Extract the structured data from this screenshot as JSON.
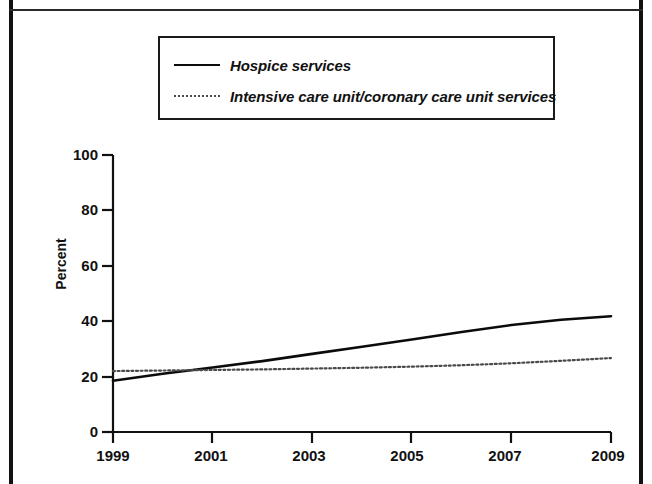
{
  "figure": {
    "background": "#ffffff",
    "frame_color": "#111111"
  },
  "legend": {
    "position": "top-center",
    "items": [
      {
        "label": "Hospice services",
        "style": "solid",
        "color": "#0b0b0b"
      },
      {
        "label": "Intensive care unit/coronary care unit services",
        "style": "dotted",
        "color": "#4a4a4a"
      }
    ]
  },
  "axes": {
    "ylabel": "Percent",
    "yticks": [
      "100",
      "80",
      "60",
      "40",
      "20",
      "0"
    ],
    "xticks": [
      "1999",
      "2001",
      "2003",
      "2005",
      "2007",
      "2009"
    ]
  },
  "chart_data": {
    "type": "line",
    "title": "",
    "subtitle": "",
    "xlabel": "",
    "ylabel": "Percent",
    "xlim": [
      1999,
      2009
    ],
    "ylim": [
      0,
      100
    ],
    "ytick_values": [
      0,
      20,
      40,
      60,
      80,
      100
    ],
    "xtick_values": [
      1999,
      2001,
      2003,
      2005,
      2007,
      2009
    ],
    "grid": false,
    "legend_position": "top-center",
    "x": [
      1999,
      2000,
      2001,
      2002,
      2003,
      2004,
      2005,
      2006,
      2007,
      2008,
      2009
    ],
    "series": [
      {
        "name": "Hospice services",
        "style": "solid",
        "color": "#0b0b0b",
        "values": [
          18.5,
          21.0,
          23.3,
          25.6,
          28.2,
          30.8,
          33.4,
          36.1,
          38.6,
          40.5,
          41.8
        ]
      },
      {
        "name": "Intensive care unit/coronary care unit services",
        "style": "dotted",
        "color": "#4a4a4a",
        "values": [
          22.0,
          22.2,
          22.4,
          22.6,
          22.9,
          23.2,
          23.6,
          24.1,
          24.8,
          25.7,
          26.7
        ]
      }
    ],
    "annotations": []
  }
}
